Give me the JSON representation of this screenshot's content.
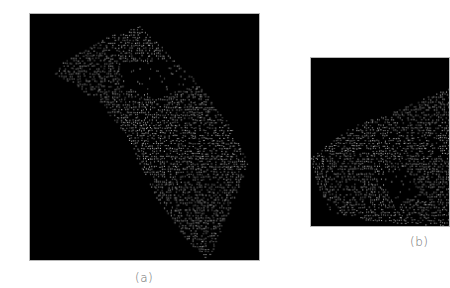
{
  "figure": {
    "panels": [
      {
        "id": "a",
        "caption": "(a)",
        "description": "point cloud rendering, diagonal strip with grid of dots",
        "background": "#000000",
        "point_color": "#d8d8d8"
      },
      {
        "id": "b",
        "caption": "(b)",
        "description": "point cloud rendering, cropped at right edge",
        "background": "#000000",
        "point_color": "#d8d8d8"
      }
    ]
  }
}
